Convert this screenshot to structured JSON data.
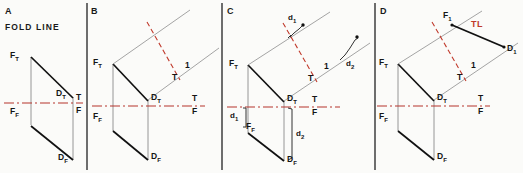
{
  "figure": {
    "background_color": "#fbfbf9",
    "colors": {
      "object_line": "#111111",
      "projection_line": "#8a8a8a",
      "fold_line": "#b5342c",
      "true_length_accent": "#c0392b",
      "divider": "#555555"
    },
    "panels": [
      {
        "id": "A",
        "letter": "A",
        "caption": "FOLD LINE",
        "points": [
          {
            "name": "F_T",
            "label_main": "F",
            "label_sub": "T"
          },
          {
            "name": "D_T",
            "label_main": "D",
            "label_sub": "T"
          },
          {
            "name": "F_F",
            "label_main": "F",
            "label_sub": "F"
          },
          {
            "name": "D_F",
            "label_main": "D",
            "label_sub": "F"
          }
        ],
        "fold_labels": [
          {
            "above": "T",
            "below": "F"
          }
        ]
      },
      {
        "id": "B",
        "letter": "B",
        "caption": "",
        "points": [
          {
            "name": "F_T",
            "label_main": "F",
            "label_sub": "T"
          },
          {
            "name": "D_T",
            "label_main": "D",
            "label_sub": "T"
          },
          {
            "name": "F_F",
            "label_main": "F",
            "label_sub": "F"
          },
          {
            "name": "D_F",
            "label_main": "D",
            "label_sub": "F"
          }
        ],
        "fold_labels": [
          {
            "above": "T",
            "below": "F"
          },
          {
            "above": "1",
            "below": "T"
          }
        ]
      },
      {
        "id": "C",
        "letter": "C",
        "caption": "",
        "points": [
          {
            "name": "F_T",
            "label_main": "F",
            "label_sub": "T"
          },
          {
            "name": "D_T",
            "label_main": "D",
            "label_sub": "T"
          },
          {
            "name": "F_F",
            "label_main": "F",
            "label_sub": "F"
          },
          {
            "name": "D_F",
            "label_main": "D",
            "label_sub": "F"
          }
        ],
        "fold_labels": [
          {
            "above": "T",
            "below": "F"
          },
          {
            "above": "1",
            "below": "T"
          }
        ],
        "dimensions": [
          {
            "name": "d1-front",
            "main": "d",
            "sub": "1"
          },
          {
            "name": "d2-front",
            "main": "d",
            "sub": "2"
          },
          {
            "name": "d1-aux",
            "main": "d",
            "sub": "1"
          },
          {
            "name": "d2-aux",
            "main": "d",
            "sub": "2"
          }
        ]
      },
      {
        "id": "D",
        "letter": "D",
        "caption": "",
        "points": [
          {
            "name": "F_T",
            "label_main": "F",
            "label_sub": "T"
          },
          {
            "name": "D_T",
            "label_main": "D",
            "label_sub": "T"
          },
          {
            "name": "F_F",
            "label_main": "F",
            "label_sub": "F"
          },
          {
            "name": "D_F",
            "label_main": "D",
            "label_sub": "F"
          },
          {
            "name": "F_1",
            "label_main": "F",
            "label_sub": "1"
          },
          {
            "name": "D_1",
            "label_main": "D",
            "label_sub": "1"
          }
        ],
        "fold_labels": [
          {
            "above": "T",
            "below": "F"
          },
          {
            "above": "1",
            "below": "T"
          }
        ],
        "annotations": [
          {
            "name": "true-length",
            "text": "TL"
          }
        ]
      }
    ]
  },
  "labels": {
    "panelA_letter": "A",
    "panelA_caption": "FOLD LINE",
    "panelB_letter": "B",
    "panelC_letter": "C",
    "panelD_letter": "D",
    "T": "T",
    "F": "F",
    "one": "1",
    "TL": "TL",
    "d": "d",
    "sub1": "1",
    "sub2": "2",
    "subT": "T",
    "subF": "F"
  }
}
